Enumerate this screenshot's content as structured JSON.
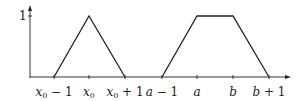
{
  "diagram": {
    "type": "membership-functions",
    "y_tick_label": "1",
    "x_labels": [
      {
        "id": "x0m1",
        "var": "x",
        "sub": "0",
        "suffix": " − 1",
        "x": 54
      },
      {
        "id": "x0",
        "var": "x",
        "sub": "0",
        "suffix": "",
        "x": 89
      },
      {
        "id": "x0p1",
        "var": "x",
        "sub": "0",
        "suffix": " + 1",
        "x": 125
      },
      {
        "id": "am1",
        "var": "a",
        "sub": "",
        "suffix": " − 1",
        "x": 162
      },
      {
        "id": "a",
        "var": "a",
        "sub": "",
        "suffix": "",
        "x": 197
      },
      {
        "id": "b",
        "var": "b",
        "sub": "",
        "suffix": "",
        "x": 233
      },
      {
        "id": "bp1",
        "var": "b",
        "sub": "",
        "suffix": " + 1",
        "x": 269
      }
    ],
    "shapes": [
      {
        "name": "triangle",
        "points": [
          [
            54,
            77
          ],
          [
            89,
            16
          ],
          [
            125,
            77
          ]
        ]
      },
      {
        "name": "trapezoid",
        "points": [
          [
            162,
            77
          ],
          [
            197,
            16
          ],
          [
            233,
            16
          ],
          [
            269,
            77
          ]
        ]
      }
    ],
    "colors": {
      "line": "#222222",
      "axis": "#333333"
    }
  }
}
